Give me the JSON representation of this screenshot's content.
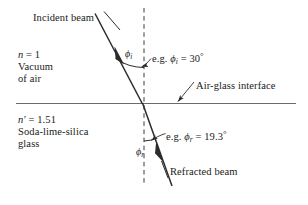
{
  "figure": {
    "background_color": "#ffffff",
    "line_color": "#2b2b2b",
    "interface_color": "#5a5a5a",
    "width": 308,
    "height": 205
  },
  "labels": {
    "incident_beam": "Incident beam",
    "refracted_beam": "Refracted beam",
    "interface": "Air-glass interface",
    "medium_air": {
      "index_symbol": "n",
      "index_equals": " = 1",
      "line2": "Vacuum",
      "line3": "of air"
    },
    "medium_glass": {
      "index_symbol": "n′",
      "index_equals": " = 1.51",
      "line2": "Soda-lime-silica",
      "line3": "glass"
    },
    "angle_incident_symbol": "ϕ",
    "angle_incident_subscript": "i",
    "angle_refracted_symbol": "ϕ",
    "angle_refracted_subscript": "r",
    "incident_angle_value": "e.g. ϕi = 30°",
    "incident_angle_prefix": "e.g. ",
    "incident_angle_eq": " = 30",
    "incident_angle_degree": "°",
    "refracted_angle_prefix": "e.g. ",
    "refracted_angle_eq": " = 19.3",
    "refracted_angle_degree": "°"
  },
  "physics_data": {
    "n_incident_medium": 1,
    "n_refracting_medium": 1.51,
    "angle_of_incidence_deg": 30,
    "angle_of_refraction_deg": 19.3,
    "incident_medium_name": "Vacuum of air",
    "refracting_medium_name": "Soda-lime-silica glass",
    "interface_name": "Air-glass interface"
  },
  "geometry": {
    "interface_y": 103,
    "normal_x": 144,
    "normal_top_y": 8,
    "normal_bottom_y": 186,
    "incidence_point": [
      142,
      103
    ],
    "incident_ray_start": [
      95,
      14
    ],
    "refracted_ray_end": [
      172,
      186
    ]
  }
}
